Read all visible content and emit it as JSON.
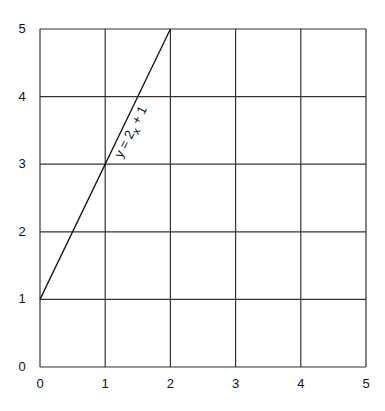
{
  "chart_data": {
    "type": "line",
    "title": "",
    "xlabel": "",
    "ylabel": "",
    "xlim": [
      0,
      5
    ],
    "ylim": [
      0,
      5
    ],
    "grid": true,
    "x_ticks": [
      "0",
      "1",
      "2",
      "3",
      "4",
      "5"
    ],
    "y_ticks": [
      "0",
      "1",
      "2",
      "3",
      "4",
      "5"
    ],
    "series": [
      {
        "name": "y = 2x + 1",
        "x": [
          0,
          2
        ],
        "y": [
          1,
          5
        ],
        "equation": "y = 2x + 1"
      }
    ],
    "annotations": [
      {
        "text_main": "y = 2",
        "text_sub": "x",
        "text_tail": " + 1",
        "x": 1.45,
        "y": 3.45,
        "rotation": -63
      }
    ]
  }
}
